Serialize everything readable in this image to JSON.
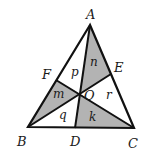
{
  "diagram": {
    "type": "triangle-cevians",
    "colors": {
      "stroke": "#111111",
      "shade": "#b3b3b3",
      "background": "#ffffff"
    },
    "points": {
      "A": {
        "label": "A",
        "x": 90,
        "y": 25
      },
      "B": {
        "label": "B",
        "x": 28,
        "y": 127
      },
      "C": {
        "label": "C",
        "x": 134,
        "y": 128
      },
      "D": {
        "label": "D",
        "x": 75,
        "y": 128
      },
      "E": {
        "label": "E",
        "x": 111,
        "y": 74
      },
      "F": {
        "label": "F",
        "x": 56,
        "y": 80
      },
      "O": {
        "label": "O",
        "x": 80,
        "y": 94
      }
    },
    "regions": [
      {
        "label": "p",
        "shaded": false
      },
      {
        "label": "n",
        "shaded": true
      },
      {
        "label": "m",
        "shaded": true
      },
      {
        "label": "r",
        "shaded": false
      },
      {
        "label": "q",
        "shaded": false
      },
      {
        "label": "k",
        "shaded": true
      }
    ]
  }
}
